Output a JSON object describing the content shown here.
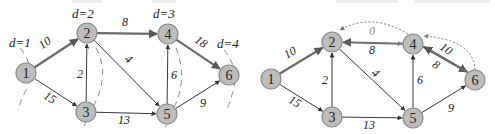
{
  "colors": {
    "node_fill": "#bdbdbd",
    "node_stroke": "#8a8a8a",
    "edge": "#3a3a3a",
    "edge_bold": "#6a6a6a",
    "dashed_cut": "#8c8c8c",
    "dotted": "#7a7a7a",
    "label": "#222222"
  },
  "left_graph": {
    "nodes": [
      {
        "id": "1",
        "label": "1",
        "x": 26,
        "y": 73
      },
      {
        "id": "2",
        "label": "2",
        "x": 87,
        "y": 33
      },
      {
        "id": "3",
        "label": "3",
        "x": 86,
        "y": 112
      },
      {
        "id": "4",
        "label": "4",
        "x": 168,
        "y": 34
      },
      {
        "id": "5",
        "label": "5",
        "x": 167,
        "y": 114
      },
      {
        "id": "6",
        "label": "6",
        "x": 229,
        "y": 75
      }
    ],
    "edges": [
      {
        "from": "1",
        "to": "2",
        "weight": "10",
        "bold": true,
        "lx": 47,
        "ly": 46,
        "rot": -35
      },
      {
        "from": "1",
        "to": "3",
        "weight": "15",
        "bold": false,
        "lx": 48,
        "ly": 101,
        "rot": 30
      },
      {
        "from": "3",
        "to": "2",
        "weight": "2",
        "bold": false,
        "lx": 80,
        "ly": 78,
        "rot": 0
      },
      {
        "from": "2",
        "to": "4",
        "weight": "8",
        "bold": true,
        "lx": 125,
        "ly": 26,
        "rot": 0
      },
      {
        "from": "2",
        "to": "5",
        "weight": "4",
        "bold": false,
        "lx": 126,
        "ly": 62,
        "rot": 40
      },
      {
        "from": "3",
        "to": "5",
        "weight": "13",
        "bold": false,
        "lx": 124,
        "ly": 124,
        "rot": 0
      },
      {
        "from": "5",
        "to": "4",
        "weight": "6",
        "bold": false,
        "lx": 174,
        "ly": 79,
        "rot": 0
      },
      {
        "from": "4",
        "to": "6",
        "weight": "18",
        "bold": true,
        "lx": 199,
        "ly": 45,
        "rot": 35
      },
      {
        "from": "5",
        "to": "6",
        "weight": "9",
        "bold": false,
        "lx": 203,
        "ly": 107,
        "rot": 0
      }
    ],
    "distance_labels": [
      {
        "text": "d=1",
        "x": 9,
        "y": 47
      },
      {
        "text": "d=2",
        "x": 72,
        "y": 18
      },
      {
        "text": "d=3",
        "x": 153,
        "y": 18
      },
      {
        "text": "d=4",
        "x": 217,
        "y": 48
      }
    ],
    "cut_arcs": [
      {
        "d": "M 20 48 Q 36 66 26 90 Q 20 102 18 110"
      },
      {
        "d": "M 96 48 Q 108 70 98 96 Q 92 110 84 126"
      },
      {
        "d": "M 176 48 Q 186 72 178 98 Q 172 114 164 130"
      },
      {
        "d": "M 224 50 Q 238 66 234 88 Q 230 102 226 112"
      }
    ]
  },
  "right_graph": {
    "nodes": [
      {
        "id": "1",
        "label": "1",
        "x": 271,
        "y": 79
      },
      {
        "id": "2",
        "label": "2",
        "x": 332,
        "y": 42
      },
      {
        "id": "3",
        "label": "3",
        "x": 332,
        "y": 117
      },
      {
        "id": "4",
        "label": "4",
        "x": 413,
        "y": 44
      },
      {
        "id": "5",
        "label": "5",
        "x": 413,
        "y": 118
      },
      {
        "id": "6",
        "label": "6",
        "x": 475,
        "y": 80
      }
    ],
    "edges": [
      {
        "from": "1",
        "to": "2",
        "weight": "10",
        "bold": true,
        "lx": 292,
        "ly": 56,
        "rot": -30
      },
      {
        "from": "1",
        "to": "3",
        "weight": "15",
        "bold": false,
        "lx": 293,
        "ly": 105,
        "rot": 30
      },
      {
        "from": "3",
        "to": "2",
        "weight": "2",
        "bold": false,
        "lx": 325,
        "ly": 84,
        "rot": 0
      },
      {
        "from": "4",
        "to": "2",
        "weight": "8",
        "bold": true,
        "lx": 372,
        "ly": 54,
        "rot": 0
      },
      {
        "from": "2",
        "to": "5",
        "weight": "4",
        "bold": false,
        "lx": 373,
        "ly": 76,
        "rot": 40
      },
      {
        "from": "3",
        "to": "5",
        "weight": "13",
        "bold": false,
        "lx": 369,
        "ly": 129,
        "rot": 0
      },
      {
        "from": "5",
        "to": "4",
        "weight": "6",
        "bold": false,
        "lx": 420,
        "ly": 84,
        "rot": 0
      },
      {
        "from": "4",
        "to": "6",
        "weight": "10",
        "bold": true,
        "lx": 444,
        "ly": 52,
        "rot": 35,
        "offset": -3
      },
      {
        "from": "6",
        "to": "4",
        "weight": "8",
        "bold": true,
        "lx": 434,
        "ly": 68,
        "rot": 35,
        "offset": 3
      },
      {
        "from": "5",
        "to": "6",
        "weight": "9",
        "bold": false,
        "lx": 451,
        "ly": 112,
        "rot": 0
      }
    ],
    "dashed_edges": [
      {
        "from": "2",
        "to": "4",
        "weight": "0",
        "lx": 372,
        "ly": 35
      }
    ],
    "dotted_arcs": [
      {
        "d": "M 408 34 Q 372 12 340 30",
        "label": "4-to-2 residual"
      },
      {
        "d": "M 475 70 Q 474 40 424 36",
        "label": "6-to-4 residual"
      }
    ]
  }
}
